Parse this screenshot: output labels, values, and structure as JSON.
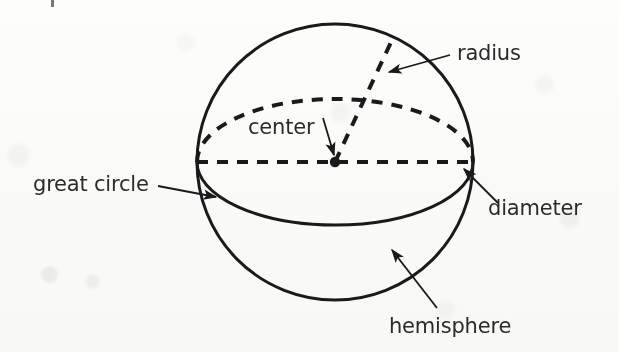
{
  "figure": {
    "background_color": "#fdfdfc",
    "ink_color": "#1a1a1a",
    "text_color": "#2b2b2b"
  },
  "geometry": {
    "sphere_center": {
      "x": 335,
      "y": 162
    },
    "sphere_radius": 138,
    "great_circle_ellipse": {
      "cx": 335,
      "cy": 162,
      "rx": 138,
      "ry": 63
    },
    "center_dot": {
      "x": 335,
      "y": 162,
      "r": 5
    },
    "radius_endpoint": {
      "x": 392,
      "y": 40
    },
    "diameter_left": {
      "x": 197,
      "y": 162
    },
    "diameter_right": {
      "x": 473,
      "y": 162
    }
  },
  "labels": [
    {
      "id": "radius",
      "text": "radius",
      "text_x": 457,
      "text_y": 60,
      "leader_from": {
        "x": 450,
        "y": 55
      },
      "leader_to": {
        "x": 389,
        "y": 72
      }
    },
    {
      "id": "center",
      "text": "center",
      "text_x": 248,
      "text_y": 134,
      "leader_from": {
        "x": 323,
        "y": 118
      },
      "leader_to": {
        "x": 334,
        "y": 157
      }
    },
    {
      "id": "great-circle",
      "text": "great circle",
      "text_x": 33,
      "text_y": 191,
      "leader_from": {
        "x": 158,
        "y": 186
      },
      "leader_to": {
        "x": 215,
        "y": 197
      }
    },
    {
      "id": "diameter",
      "text": "diameter",
      "text_x": 488,
      "text_y": 215,
      "leader_from": {
        "x": 498,
        "y": 203
      },
      "leader_to": {
        "x": 462,
        "y": 168
      }
    },
    {
      "id": "hemisphere",
      "text": "hemisphere",
      "text_x": 389,
      "text_y": 333,
      "leader_from": {
        "x": 435,
        "y": 306
      },
      "leader_to": {
        "x": 392,
        "y": 250
      }
    }
  ],
  "line_styles": {
    "solid_stroke_width": 3,
    "dashed_stroke_width": 4,
    "dash_pattern": "11 9",
    "leader_stroke_width": 1.8
  }
}
